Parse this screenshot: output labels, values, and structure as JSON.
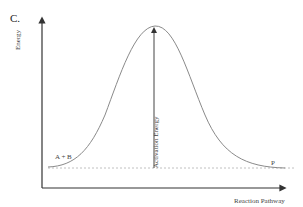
{
  "diagram": {
    "panel_label": "C.",
    "y_axis_label": "Energy",
    "x_axis_label": "Reaction Pathway",
    "reactants_label": "A + B",
    "products_label": "P",
    "arrow_label": "Activation Energy",
    "colors": {
      "axes": "#333333",
      "curve": "#8a8a8a",
      "dashed_baseline": "#b0b0b0",
      "arrow": "#444444"
    }
  }
}
